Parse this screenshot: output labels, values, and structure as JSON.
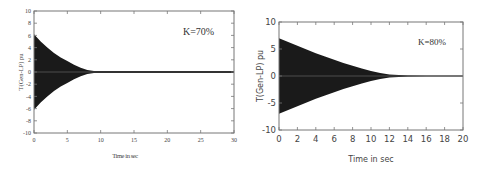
{
  "chart_data": [
    {
      "type": "area",
      "title": "",
      "annotation": "K=70%",
      "xlabel": "Time in sec",
      "ylabel": "T(Gen-LP) pu",
      "xlim": [
        0,
        30
      ],
      "ylim": [
        -10,
        10
      ],
      "xticks": [
        0,
        5,
        10,
        15,
        20,
        25,
        30
      ],
      "yticks": [
        -10,
        -8,
        -6,
        -4,
        -2,
        0,
        2,
        4,
        6,
        8,
        10
      ],
      "grid": false,
      "legend": null,
      "description": "Damped oscillation of torque between generator and LP turbine; oscillation envelope decays from about ±6.2 pu at t=0 to ~0 at t≈9 s, then flat near 0 until 30 s",
      "envelope": {
        "x": [
          0,
          1,
          2,
          3,
          4,
          5,
          6,
          7,
          8,
          9,
          10,
          15,
          20,
          25,
          30
        ],
        "upper": [
          6.2,
          5.0,
          4.0,
          3.1,
          2.4,
          1.8,
          1.2,
          0.7,
          0.35,
          0.15,
          0.1,
          0.1,
          0.1,
          0.1,
          0.1
        ],
        "lower": [
          -6.2,
          -5.0,
          -4.0,
          -3.1,
          -2.4,
          -1.8,
          -1.2,
          -0.7,
          -0.35,
          -0.15,
          -0.1,
          -0.1,
          -0.1,
          -0.1,
          -0.1
        ]
      }
    },
    {
      "type": "area",
      "title": "",
      "annotation": "K=80%",
      "xlabel": "Time in sec",
      "ylabel": "T(Gen-LP) pu",
      "xlim": [
        0,
        20
      ],
      "ylim": [
        -10,
        10
      ],
      "xticks": [
        0,
        2,
        4,
        6,
        8,
        10,
        12,
        14,
        16,
        18,
        20
      ],
      "yticks": [
        -10,
        -5,
        0,
        5,
        10
      ],
      "grid": false,
      "legend": null,
      "description": "Damped oscillation of torque between generator and LP turbine; oscillation envelope decays from about ±7 pu at t=0 to ~0 at t≈14 s, then flat near 0 until 20 s",
      "envelope": {
        "x": [
          0,
          1,
          2,
          3,
          4,
          5,
          6,
          7,
          8,
          9,
          10,
          11,
          12,
          13,
          14,
          16,
          18,
          20
        ],
        "upper": [
          7.0,
          6.3,
          5.6,
          4.9,
          4.2,
          3.6,
          3.0,
          2.4,
          1.9,
          1.4,
          0.9,
          0.55,
          0.3,
          0.2,
          0.1,
          0.05,
          0.05,
          0.05
        ],
        "lower": [
          -7.0,
          -6.3,
          -5.6,
          -4.9,
          -4.2,
          -3.6,
          -3.0,
          -2.4,
          -1.9,
          -1.4,
          -0.9,
          -0.55,
          -0.3,
          -0.2,
          -0.1,
          -0.05,
          -0.05,
          -0.05
        ]
      }
    }
  ],
  "left": {
    "annotation": "K=70%",
    "ylabel": "T(Gen-LP) pu",
    "xlabel": "Time in sec",
    "xticks": [
      "0",
      "5",
      "10",
      "15",
      "20",
      "25",
      "30"
    ],
    "yticks": [
      "10",
      "8",
      "6",
      "4",
      "2",
      "0",
      "-2",
      "-4",
      "-6",
      "-8",
      "-10"
    ]
  },
  "right": {
    "annotation": "K=80%",
    "ylabel": "T(Gen-LP) pu",
    "xlabel": "Time in sec",
    "xticks": [
      "0",
      "2",
      "4",
      "6",
      "8",
      "10",
      "12",
      "14",
      "16",
      "18",
      "20"
    ],
    "yticks": [
      "10",
      "5",
      "0",
      "-5",
      "-10"
    ]
  },
  "colors": {
    "signal": "#1a1a1a",
    "axes": "#555555",
    "text": "#333333"
  }
}
